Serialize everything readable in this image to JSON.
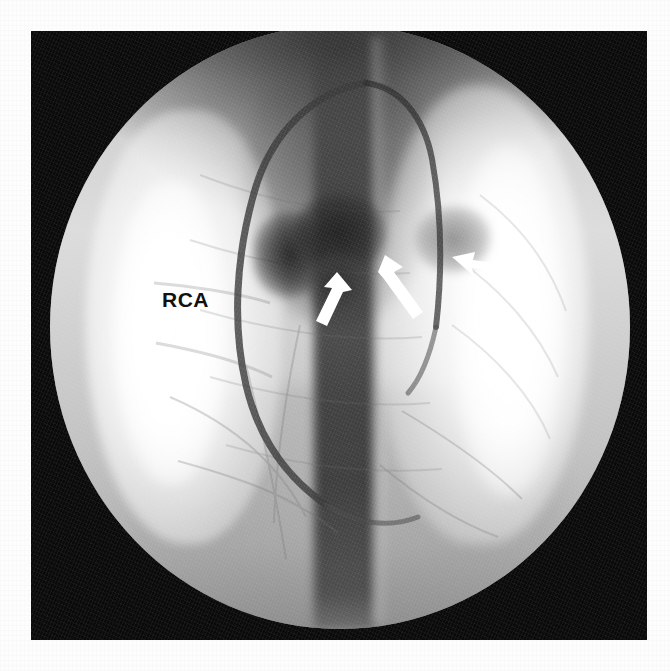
{
  "page": {
    "background_color": "#fdfdfd",
    "frame_color": "#0a0a0a"
  },
  "image": {
    "modality_name": "coronary-angiogram",
    "view_name": "fluoroscopic-cine-frame",
    "field_shape": "circular-image-intensifier-field",
    "colorspace": "grayscale"
  },
  "annotations": {
    "labels": [
      {
        "name": "rca-label",
        "text": "RCA",
        "color": "#111111",
        "x": 131,
        "y": 258
      }
    ],
    "arrows": [
      {
        "name": "arrow-1",
        "icon": "arrow-up-left-icon",
        "color": "#ffffff",
        "tip_x": 306,
        "tip_y": 241,
        "tail_x": 288,
        "tail_y": 289
      },
      {
        "name": "arrow-2",
        "icon": "arrow-up-left-icon",
        "color": "#ffffff",
        "tip_x": 354,
        "tip_y": 224,
        "tail_x": 382,
        "tail_y": 273
      },
      {
        "name": "arrow-3",
        "icon": "arrow-left-icon",
        "color": "#ffffff",
        "tip_x": 421,
        "tip_y": 226,
        "tail_x": 456,
        "tail_y": 233
      }
    ]
  },
  "structures": {
    "catheter_loop_name": "catheter-contrast-loop",
    "spine_band_name": "mediastinal-spine-band",
    "lung_left_name": "lung-field-left",
    "lung_right_name": "lung-field-right",
    "contrast_blobs": [
      "contrast-blob-central",
      "contrast-blob-left",
      "contrast-blob-right",
      "contrast-blob-inferior"
    ]
  }
}
